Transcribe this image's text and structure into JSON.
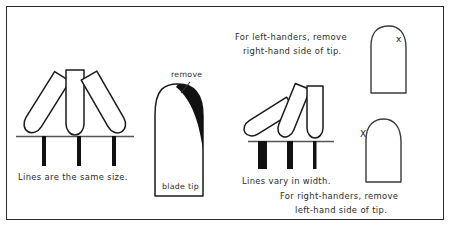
{
  "diagram": {
    "frame_color": "#2b2b2b",
    "ink_color": "#111111",
    "paper_color": "#ffffff"
  },
  "panels": {
    "left": {
      "caption": "Lines are the same size.",
      "nib_count": 3,
      "nib_angles_deg": [
        30,
        0,
        -30
      ],
      "stroke_widths_px": [
        4,
        4,
        4
      ],
      "stroke_note": "uniform"
    },
    "center": {
      "remove_label": "remove",
      "blade_label": "blade tip",
      "shaded_side": "right"
    },
    "right_nibs": {
      "caption": "Lines vary in width.",
      "nib_count": 3,
      "nib_angles_deg": [
        52,
        22,
        0
      ],
      "stroke_widths_px": [
        9,
        6,
        3
      ],
      "stroke_note": "varying"
    },
    "top_right": {
      "caption_line1": "For left-handers, remove",
      "caption_line2": "right-hand side of tip.",
      "x_label": "x",
      "x_side": "right"
    },
    "bottom_right": {
      "caption_line1": "For right-handers, remove",
      "caption_line2": "left-hand side of tip.",
      "x_label": "X",
      "x_side": "left"
    }
  }
}
